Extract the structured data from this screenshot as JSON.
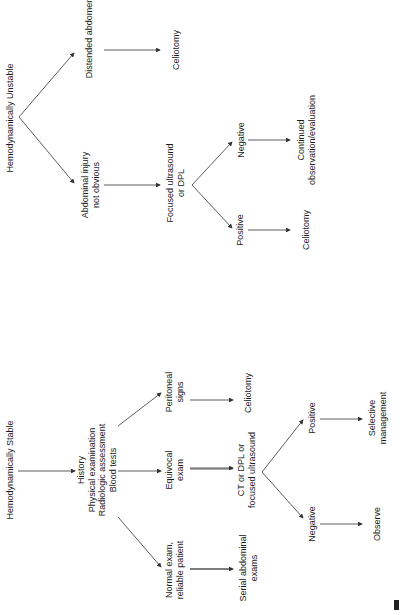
{
  "orientation": "rotated-90-ccw",
  "unstable": {
    "root": "Hemodynamically Unstable",
    "branch_left": "Abdominal injury\nnot obvious",
    "branch_right": "Distended abdomen",
    "right_outcome": "Celiotomy",
    "test": "Focused ultrasound\nor DPL",
    "positive": "Positive",
    "positive_outcome": "Celiotomy",
    "negative": "Negative",
    "negative_outcome": "Continued\nobservation/evaluation"
  },
  "stable": {
    "root": "Hemodynamically Stable",
    "assessment": "History\nPhysical examination\nRadiologic assessment\nBlood tests",
    "branch_normal": "Normal exam,\nreliable patient",
    "branch_equivocal": "Equivocal\nexam",
    "branch_peritoneal": "Peritoneal\nsigns",
    "normal_outcome": "Serial abdominal\nexams",
    "equivocal_test": "CT or DPL or\nfocused ultrasound",
    "peritoneal_outcome": "Celiotomy",
    "negative": "Negative",
    "negative_outcome": "Observe",
    "positive": "Positive",
    "positive_outcome": "Selective\nmanagement"
  },
  "colors": {
    "line": "#333333",
    "text": "#1a1a1a",
    "background": "#ffffff"
  }
}
